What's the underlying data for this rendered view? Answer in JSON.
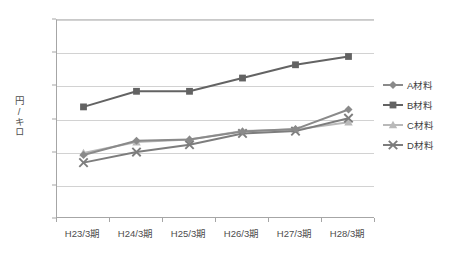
{
  "chart_data": {
    "type": "line",
    "title": "",
    "subtitle": "",
    "xlabel": "",
    "ylabel": "円/キロ",
    "categories": [
      "H23/3期",
      "H24/3期",
      "H25/3期",
      "H26/3期",
      "H27/3期",
      "H28/3期"
    ],
    "ylim": [
      0,
      600
    ],
    "ytick_labels": [
      "600",
      "500",
      "400",
      "300",
      "200",
      "100"
    ],
    "ytick_values": [
      600,
      500,
      400,
      300,
      200,
      100
    ],
    "grid": true,
    "legend_position": "right",
    "series": [
      {
        "name": "A材料",
        "marker": "diamond",
        "color": "#8a8a8a",
        "values": [
          193,
          236,
          240,
          264,
          271,
          330
        ]
      },
      {
        "name": "B材料",
        "marker": "square",
        "color": "#636363",
        "values": [
          338,
          385,
          385,
          425,
          465,
          490
        ]
      },
      {
        "name": "C材料",
        "marker": "triangle",
        "color": "#b9b9b9",
        "values": [
          199,
          232,
          240,
          265,
          270,
          292
        ]
      },
      {
        "name": "D材料",
        "marker": "cross",
        "color": "#7d7d7d",
        "values": [
          170,
          202,
          224,
          258,
          265,
          304
        ]
      }
    ]
  },
  "colors": {
    "axis": "#a6a6a6",
    "grid": "#d2d2d2",
    "text": "#4d4d4d",
    "background": "#ffffff"
  }
}
